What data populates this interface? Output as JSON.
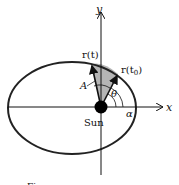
{
  "diagram": {
    "axes": {
      "x_label": "x",
      "y_label": "y"
    },
    "labels": {
      "r_t": "r(t)",
      "r_t0": "r(t",
      "r_t0_sub": "0",
      "r_t0_close": ")",
      "area": "A",
      "theta": "θ",
      "alpha": "α",
      "sun": "Sun"
    },
    "caption": "Figure"
  },
  "colors": {
    "stroke": "#111111",
    "shaded": "#b0b0b0",
    "background": "#ffffff"
  }
}
